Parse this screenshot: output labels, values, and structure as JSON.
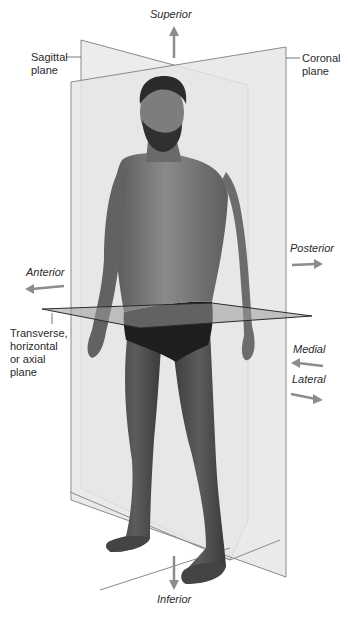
{
  "figure": {
    "planes": {
      "sagittal": "Sagittal\nplane",
      "coronal": "Coronal\nplane",
      "transverse": "Transverse,\nhorizontal\nor axial\nplane"
    },
    "directions": {
      "superior": "Superior",
      "inferior": "Inferior",
      "anterior": "Anterior",
      "posterior": "Posterior",
      "medial": "Medial",
      "lateral": "Lateral"
    },
    "colors": {
      "plane_fill": "#e9e9e9",
      "plane_edge": "#8a8a8a",
      "arrow": "#8c8c8c",
      "transverse_fill": "#a9a9a9",
      "skin": "#7a7a7a",
      "shadow": "#555555",
      "underwear": "#1e1e1e",
      "hair": "#2b2b2b",
      "text": "#2a2a2a"
    }
  }
}
